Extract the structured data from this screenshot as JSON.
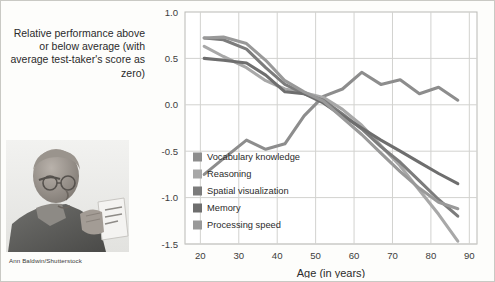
{
  "figure": {
    "y_axis_caption": "Relative performance above or below average (with average test-taker's score as zero)",
    "photo_credit": "Ann Baldwin/Shutterstock",
    "photo_alt": "elderly-man-reading-card"
  },
  "chart_data": {
    "type": "line",
    "title": "",
    "xlabel": "Age (in years)",
    "ylabel": "Relative performance above or below average (with average test-taker's score as zero)",
    "xlim": [
      16,
      92
    ],
    "ylim": [
      -1.5,
      1.0
    ],
    "xticks": [
      20,
      30,
      40,
      50,
      60,
      70,
      80,
      90
    ],
    "yticks": [
      1.0,
      0.5,
      0.0,
      -0.5,
      -1.0,
      -1.5
    ],
    "ytick_labels": [
      "1.0",
      "0.5",
      "0.0",
      "-0.5",
      "-1.0",
      "-1.5"
    ],
    "xtick_labels": [
      "20",
      "30",
      "40",
      "50",
      "60",
      "70",
      "80",
      "90"
    ],
    "grid": true,
    "legend_position": "inside-bottom-left",
    "series": [
      {
        "name": "Vocabulary knowledge",
        "color": "#8d8d8d",
        "x": [
          21,
          26,
          32,
          37,
          42,
          47,
          52,
          57,
          62,
          67,
          72,
          77,
          82,
          87
        ],
        "y": [
          -0.75,
          -0.58,
          -0.38,
          -0.48,
          -0.42,
          -0.12,
          0.09,
          0.17,
          0.35,
          0.22,
          0.27,
          0.12,
          0.19,
          0.05
        ]
      },
      {
        "name": "Reasoning",
        "color": "#a8a8a8",
        "x": [
          21,
          26,
          32,
          37,
          42,
          47,
          52,
          57,
          62,
          67,
          72,
          77,
          82,
          87
        ],
        "y": [
          0.63,
          0.52,
          0.4,
          0.26,
          0.17,
          0.13,
          0.08,
          -0.05,
          -0.22,
          -0.44,
          -0.66,
          -0.92,
          -1.18,
          -1.47
        ]
      },
      {
        "name": "Spatial visualization",
        "color": "#7c7c7c",
        "x": [
          21,
          26,
          32,
          37,
          42,
          47,
          52,
          57,
          62,
          67,
          72,
          77,
          82,
          87
        ],
        "y": [
          0.72,
          0.7,
          0.6,
          0.4,
          0.22,
          0.12,
          0.05,
          -0.1,
          -0.26,
          -0.45,
          -0.62,
          -0.82,
          -1.02,
          -1.2
        ]
      },
      {
        "name": "Memory",
        "color": "#6e6e6e",
        "x": [
          21,
          26,
          32,
          37,
          42,
          47,
          52,
          57,
          62,
          67,
          72,
          77,
          82,
          87
        ],
        "y": [
          0.5,
          0.48,
          0.45,
          0.32,
          0.14,
          0.12,
          0.02,
          -0.12,
          -0.25,
          -0.38,
          -0.5,
          -0.62,
          -0.74,
          -0.85
        ]
      },
      {
        "name": "Processing speed",
        "color": "#999999",
        "x": [
          21,
          26,
          32,
          37,
          42,
          47,
          52,
          57,
          62,
          67,
          72,
          77,
          82,
          87
        ],
        "y": [
          0.72,
          0.73,
          0.66,
          0.48,
          0.26,
          0.14,
          0.04,
          -0.14,
          -0.32,
          -0.52,
          -0.72,
          -0.9,
          -1.05,
          -1.12
        ]
      }
    ]
  }
}
